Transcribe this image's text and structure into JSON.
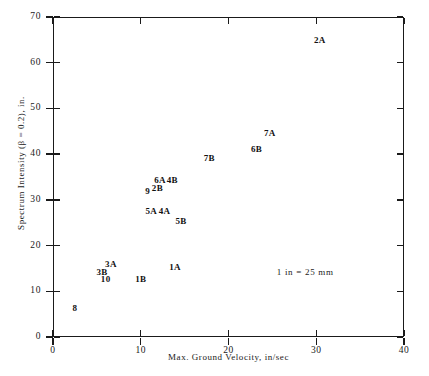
{
  "chart_data": {
    "type": "scatter",
    "title": "",
    "xlabel": "Max. Ground Velocity, in/sec",
    "ylabel": "Spectrum Intensity (β = 0.2), in.",
    "xlim": [
      0,
      40
    ],
    "ylim": [
      0,
      70
    ],
    "xticks": [
      "0",
      "10",
      "20",
      "30",
      "40"
    ],
    "xtick_values": [
      0,
      10,
      20,
      30,
      40
    ],
    "yticks": [
      "0",
      "10",
      "20",
      "30",
      "40",
      "50",
      "60",
      "70"
    ],
    "ytick_values": [
      0,
      10,
      20,
      30,
      40,
      50,
      60,
      70
    ],
    "grid": false,
    "legend": null,
    "annotations": [
      {
        "text": "1 in = 25 mm",
        "x": 25.5,
        "y": 14.3
      }
    ],
    "points": [
      {
        "label": "2A",
        "x": 30.4,
        "y": 64.9
      },
      {
        "label": "7A",
        "x": 24.7,
        "y": 44.6
      },
      {
        "label": "6B",
        "x": 23.2,
        "y": 41.2
      },
      {
        "label": "7B",
        "x": 17.8,
        "y": 39.1
      },
      {
        "label": "6A",
        "x": 12.2,
        "y": 34.4
      },
      {
        "label": "4B",
        "x": 13.6,
        "y": 34.4
      },
      {
        "label": "9",
        "x": 10.8,
        "y": 32.0
      },
      {
        "label": "2B",
        "x": 11.9,
        "y": 32.6
      },
      {
        "label": "5A",
        "x": 11.2,
        "y": 27.6
      },
      {
        "label": "4A",
        "x": 12.7,
        "y": 27.6
      },
      {
        "label": "5B",
        "x": 14.6,
        "y": 25.3
      },
      {
        "label": "3A",
        "x": 6.6,
        "y": 15.9
      },
      {
        "label": "1A",
        "x": 13.9,
        "y": 15.4
      },
      {
        "label": "3B",
        "x": 5.6,
        "y": 14.2
      },
      {
        "label": "10",
        "x": 6.0,
        "y": 12.7
      },
      {
        "label": "1B",
        "x": 10.0,
        "y": 12.6
      },
      {
        "label": "8",
        "x": 2.5,
        "y": 6.3
      }
    ]
  }
}
